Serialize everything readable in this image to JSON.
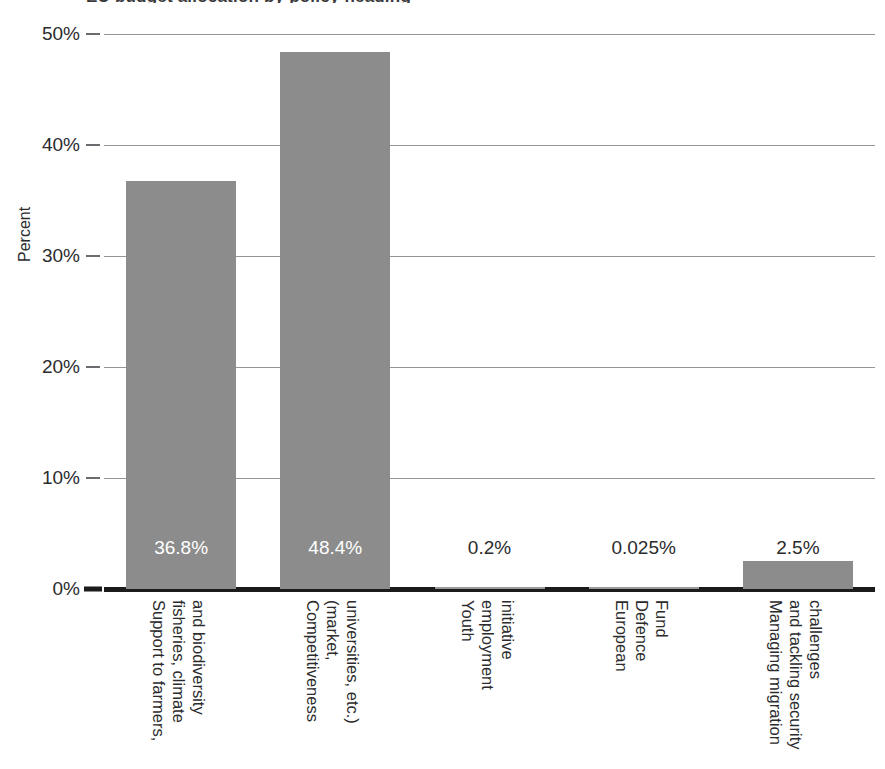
{
  "figure": {
    "title_sliver": "EU budget allocation by policy heading",
    "background": "#ffffff",
    "bar_color": "#8c8c8c",
    "grid_color": "#949499",
    "axis_color": "#1b1b1b"
  },
  "chart_data": {
    "type": "bar",
    "title": "",
    "xlabel": "",
    "ylabel": "Percent",
    "ylim": [
      0,
      50
    ],
    "ytick_labels": [
      "0%",
      "10%",
      "20%",
      "30%",
      "40%",
      "50%"
    ],
    "ytick_values": [
      0,
      10,
      20,
      30,
      40,
      50
    ],
    "grid": true,
    "legend": "none",
    "categories": [
      "Support to farmers, fisheries, climate and biodiversity",
      "Competitiveness (market, universities, etc.)",
      "Youth employment initiative",
      "European Defence Fund",
      "Managing migration and tackling security challenges"
    ],
    "category_lines": [
      [
        "Support to farmers,",
        "fisheries, climate",
        "and biodiversity"
      ],
      [
        "Competitiveness",
        "(market,",
        "universities, etc.)"
      ],
      [
        "Youth",
        "employment",
        "initiative"
      ],
      [
        "European",
        "Defence",
        "Fund"
      ],
      [
        "Managing migration",
        "and tackling security",
        "challenges"
      ]
    ],
    "values": [
      36.8,
      48.4,
      0.2,
      0.025,
      2.5
    ],
    "value_labels": [
      "36.8%",
      "48.4%",
      "0.2%",
      "0.025%",
      "2.5%"
    ],
    "value_label_placement": [
      "inside",
      "inside",
      "outside",
      "outside",
      "outside"
    ]
  }
}
